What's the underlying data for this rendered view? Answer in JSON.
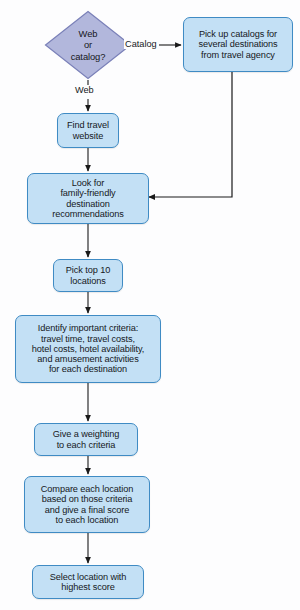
{
  "diagram": {
    "colors": {
      "process_fill": "#c3e0f5",
      "process_border": "#3f8bc4",
      "decision_fill": "#b2b7dc",
      "decision_border": "#7a80b8",
      "connector": "#1a1a1a",
      "text": "#16181c",
      "background": "#fdfdfe"
    },
    "nodes": [
      {
        "id": "decision-web-or-catalog",
        "type": "decision",
        "text": "Web\nor\ncatalog?"
      },
      {
        "id": "pick-up-catalogs",
        "type": "process",
        "text": "Pick up catalogs for\nseveral destinations\nfrom travel agency"
      },
      {
        "id": "find-travel-website",
        "type": "process",
        "text": "Find travel\nwebsite"
      },
      {
        "id": "look-for-recommendations",
        "type": "process",
        "text": "Look for\nfamily-friendly\ndestination\nrecommendations"
      },
      {
        "id": "pick-top-10-locations",
        "type": "process",
        "text": "Pick top 10\nlocations"
      },
      {
        "id": "identify-important-criteria",
        "type": "process",
        "text": "Identify important criteria:\ntravel time, travel costs,\nhotel costs, hotel availability,\nand amusement activities\nfor each destination"
      },
      {
        "id": "give-a-weighting",
        "type": "process",
        "text": "Give a weighting\nto each criteria"
      },
      {
        "id": "compare-each-location",
        "type": "process",
        "text": "Compare each location\nbased on those criteria\nand give a final score\nto each location"
      },
      {
        "id": "select-location",
        "type": "process",
        "text": "Select location with\nhighest score"
      }
    ],
    "edge_labels": {
      "catalog": "Catalog",
      "web": "Web"
    }
  }
}
